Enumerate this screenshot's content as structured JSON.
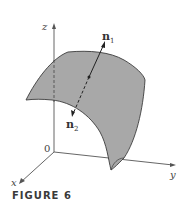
{
  "figure": {
    "caption": "FIGURE 6",
    "axes": {
      "x_label": "x",
      "y_label": "y",
      "z_label": "z",
      "origin_label": "0"
    },
    "vectors": [
      {
        "name": "n",
        "subscript": "1"
      },
      {
        "name": "n",
        "subscript": "2"
      }
    ],
    "colors": {
      "surface_fill": "#a8a8a8",
      "surface_stroke": "#3c3c3c",
      "axis": "#555555",
      "vector": "#222222"
    }
  }
}
